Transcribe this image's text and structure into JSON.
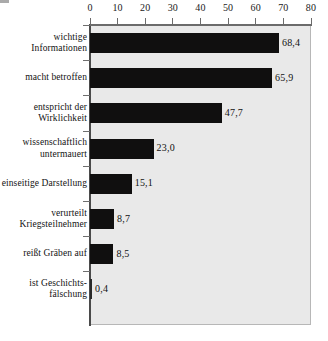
{
  "chart_data": {
    "type": "bar",
    "orientation": "horizontal",
    "title": "",
    "subtitle": "",
    "xlabel": "",
    "ylabel": "",
    "xlim": [
      0,
      80
    ],
    "xticks": [
      0,
      10,
      20,
      30,
      40,
      50,
      60,
      70,
      80
    ],
    "xtick_labels": [
      "0",
      "10",
      "20",
      "30",
      "40",
      "50",
      "60",
      "70",
      "80"
    ],
    "grid": false,
    "legend": null,
    "categories": [
      "wichtige Informationen",
      "macht betroffen",
      "entspricht der Wirklichkeit",
      "wissenschaftlich untermauert",
      "einseitige Darstellung",
      "verurteilt Kriegsteilnehmer",
      "reißt Gräben auf",
      "ist Geschichts-fälschung"
    ],
    "values": [
      68.4,
      65.9,
      47.7,
      23.0,
      15.1,
      8.7,
      8.5,
      0.4
    ],
    "value_labels": [
      "68,4",
      "65,9",
      "47,7",
      "23,0",
      "15,1",
      "8,7",
      "8,5",
      "0,4"
    ],
    "bar_color": "#100f0f",
    "plot_background": "#e9e9e9",
    "page_background": "#ffffff"
  },
  "categories": [
    {
      "lines": [
        "wichtige",
        "Informationen"
      ],
      "value": 68.4,
      "value_label": "68,4"
    },
    {
      "lines": [
        "macht betroffen"
      ],
      "value": 65.9,
      "value_label": "65,9"
    },
    {
      "lines": [
        "entspricht der",
        "Wirklichkeit"
      ],
      "value": 47.7,
      "value_label": "47,7"
    },
    {
      "lines": [
        "wissenschaftlich",
        "untermauert"
      ],
      "value": 23.0,
      "value_label": "23,0"
    },
    {
      "lines": [
        "einseitige Darstellung"
      ],
      "value": 15.1,
      "value_label": "15,1"
    },
    {
      "lines": [
        "verurteilt",
        "Kriegsteilnehmer"
      ],
      "value": 8.7,
      "value_label": "8,7"
    },
    {
      "lines": [
        "reißt Gräben auf"
      ],
      "value": 8.5,
      "value_label": "8,5"
    },
    {
      "lines": [
        "ist Geschichts-",
        "fälschung"
      ],
      "value": 0.4,
      "value_label": "0,4"
    }
  ],
  "axis": {
    "ticks": [
      {
        "label": "0"
      },
      {
        "label": "10"
      },
      {
        "label": "20"
      },
      {
        "label": "30"
      },
      {
        "label": "40"
      },
      {
        "label": "50"
      },
      {
        "label": "60"
      },
      {
        "label": "70"
      },
      {
        "label": "80"
      }
    ]
  }
}
